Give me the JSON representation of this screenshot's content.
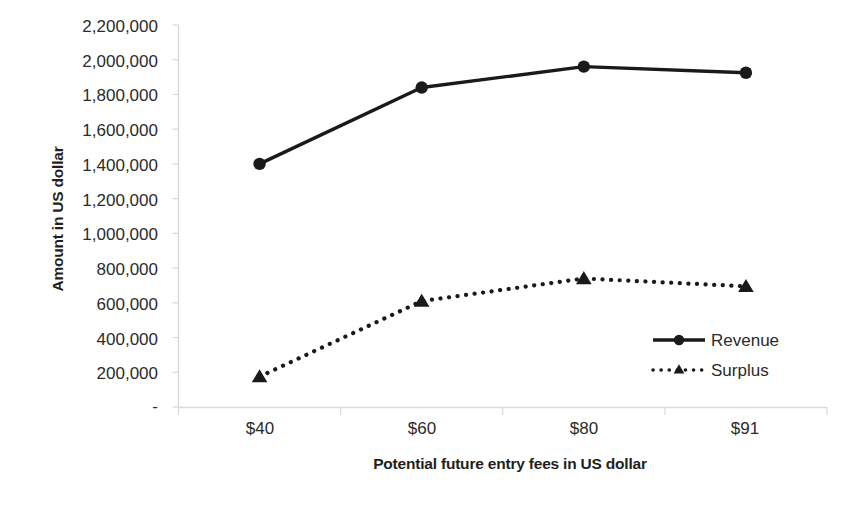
{
  "chart_data": {
    "type": "line",
    "title": "",
    "categories": [
      "$40",
      "$60",
      "$80",
      "$91"
    ],
    "series": [
      {
        "name": "Revenue",
        "values": [
          1400000,
          1840000,
          1960000,
          1925000
        ],
        "line_style": "solid",
        "marker": "circle",
        "color": "#1a1a1a"
      },
      {
        "name": "Surplus",
        "values": [
          175000,
          610000,
          740000,
          695000
        ],
        "line_style": "dotted",
        "marker": "triangle",
        "color": "#1a1a1a"
      }
    ],
    "xlabel": "Potential future entry fees in US dollar",
    "ylabel": "Amount in US dollar",
    "ylim": [
      0,
      2200000
    ],
    "ytick_values": [
      2200000,
      2000000,
      1800000,
      1600000,
      1400000,
      1200000,
      1000000,
      800000,
      600000,
      400000,
      200000,
      0
    ],
    "ytick_labels": [
      "2,200,000",
      "2,000,000",
      "1,800,000",
      "1,600,000",
      "1,400,000",
      "1,200,000",
      "1,000,000",
      "800,000",
      "600,000",
      "400,000",
      "200,000",
      "-"
    ],
    "grid": false,
    "legend_position": "inside-right",
    "legend_entries": [
      "Revenue",
      "Surplus"
    ],
    "axis_color": "#d9d9d9"
  }
}
